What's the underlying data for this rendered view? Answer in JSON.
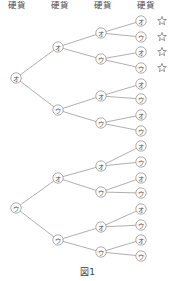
{
  "figure": {
    "caption": "図1",
    "headers": [
      {
        "label": "硬貨",
        "x": 17
      },
      {
        "label": "硬貨",
        "x": 60
      },
      {
        "label": "硬貨",
        "x": 103
      },
      {
        "label": "硬貨",
        "x": 146
      }
    ],
    "labels": {
      "heads": "オ",
      "tails": "ウ"
    },
    "star_glyph": "☆",
    "colors": {
      "line": "#8d8d8d",
      "node_stroke": "#8a8a8a",
      "text": "#4a4a4a",
      "star": "#6e6e6e",
      "background": "#ffffff"
    },
    "tree": {
      "depth": 4,
      "levels": [
        {
          "index": 0,
          "x": 16,
          "nodes": [
            {
              "id": "r0",
              "label": "オ",
              "y": 78,
              "starred": false
            },
            {
              "id": "r1",
              "label": "ウ",
              "y": 208,
              "starred": false
            }
          ]
        },
        {
          "index": 1,
          "x": 58,
          "nodes": [
            {
              "id": "n0",
              "label": "オ",
              "y": 47,
              "parent": "r0",
              "starred": false
            },
            {
              "id": "n1",
              "label": "ウ",
              "y": 110,
              "parent": "r0",
              "starred": false
            },
            {
              "id": "n2",
              "label": "オ",
              "y": 178,
              "parent": "r1",
              "starred": false
            },
            {
              "id": "n3",
              "label": "ウ",
              "y": 240,
              "parent": "r1",
              "starred": false
            }
          ]
        },
        {
          "index": 2,
          "x": 101,
          "nodes": [
            {
              "id": "m0",
              "label": "オ",
              "y": 33,
              "parent": "n0",
              "starred": false
            },
            {
              "id": "m1",
              "label": "ウ",
              "y": 59,
              "parent": "n0",
              "starred": false
            },
            {
              "id": "m2",
              "label": "オ",
              "y": 96,
              "parent": "n1",
              "starred": false
            },
            {
              "id": "m3",
              "label": "ウ",
              "y": 123,
              "parent": "n1",
              "starred": false
            },
            {
              "id": "m4",
              "label": "オ",
              "y": 166,
              "parent": "n2",
              "starred": false
            },
            {
              "id": "m5",
              "label": "ウ",
              "y": 192,
              "parent": "n2",
              "starred": false
            },
            {
              "id": "m6",
              "label": "オ",
              "y": 227,
              "parent": "n3",
              "starred": false
            },
            {
              "id": "m7",
              "label": "ウ",
              "y": 252,
              "parent": "n3",
              "starred": false
            }
          ]
        },
        {
          "index": 3,
          "x": 141,
          "nodes": [
            {
              "id": "l0",
              "label": "オ",
              "y": 21,
              "parent": "m0",
              "starred": true
            },
            {
              "id": "l1",
              "label": "ウ",
              "y": 37,
              "parent": "m0",
              "starred": true
            },
            {
              "id": "l2",
              "label": "オ",
              "y": 52,
              "parent": "m1",
              "starred": true
            },
            {
              "id": "l3",
              "label": "ウ",
              "y": 68,
              "parent": "m1",
              "starred": true
            },
            {
              "id": "l4",
              "label": "オ",
              "y": 84,
              "parent": "m2",
              "starred": false
            },
            {
              "id": "l5",
              "label": "ウ",
              "y": 99,
              "parent": "m2",
              "starred": false
            },
            {
              "id": "l6",
              "label": "オ",
              "y": 115,
              "parent": "m3",
              "starred": false
            },
            {
              "id": "l7",
              "label": "ウ",
              "y": 131,
              "parent": "m3",
              "starred": false
            },
            {
              "id": "l8",
              "label": "オ",
              "y": 146,
              "parent": "m4",
              "starred": false
            },
            {
              "id": "l9",
              "label": "ウ",
              "y": 162,
              "parent": "m4",
              "starred": false
            },
            {
              "id": "l10",
              "label": "オ",
              "y": 178,
              "parent": "m5",
              "starred": false
            },
            {
              "id": "l11",
              "label": "ウ",
              "y": 193,
              "parent": "m5",
              "starred": false
            },
            {
              "id": "l12",
              "label": "オ",
              "y": 209,
              "parent": "m6",
              "starred": false
            },
            {
              "id": "l13",
              "label": "ウ",
              "y": 225,
              "parent": "m6",
              "starred": false
            },
            {
              "id": "l14",
              "label": "オ",
              "y": 240,
              "parent": "m7",
              "starred": false
            },
            {
              "id": "l15",
              "label": "ウ",
              "y": 256,
              "parent": "m7",
              "starred": false
            }
          ]
        }
      ]
    },
    "star_x": 162,
    "node_radius": 5.2
  }
}
